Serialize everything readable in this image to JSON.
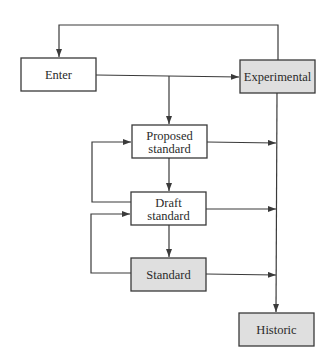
{
  "diagram": {
    "type": "flowchart",
    "nodes": {
      "enter": {
        "label": "Enter",
        "shaded": false
      },
      "experimental": {
        "label": "Experimental",
        "shaded": true
      },
      "proposed": {
        "line1": "Proposed",
        "line2": "standard",
        "shaded": false
      },
      "draft": {
        "line1": "Draft",
        "line2": "standard",
        "shaded": false
      },
      "standard": {
        "label": "Standard",
        "shaded": true
      },
      "historic": {
        "label": "Historic",
        "shaded": true
      }
    },
    "edges": [
      {
        "from": "Experimental",
        "to": "Enter"
      },
      {
        "from": "Enter",
        "to": "Experimental"
      },
      {
        "from": "Enter",
        "to": "Proposed standard"
      },
      {
        "from": "Proposed standard",
        "to": "Draft standard"
      },
      {
        "from": "Draft standard",
        "to": "Standard"
      },
      {
        "from": "Draft standard",
        "to": "Proposed standard"
      },
      {
        "from": "Standard",
        "to": "Draft standard"
      },
      {
        "from": "Proposed standard",
        "to": "Historic"
      },
      {
        "from": "Draft standard",
        "to": "Historic"
      },
      {
        "from": "Standard",
        "to": "Historic"
      },
      {
        "from": "Experimental",
        "to": "Historic"
      }
    ]
  }
}
